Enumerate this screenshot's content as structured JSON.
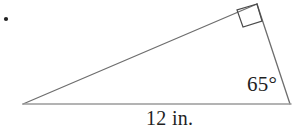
{
  "figure": {
    "kind": "right-triangle-diagram",
    "bullet": {
      "visible": true,
      "x": 6,
      "y": 19,
      "radius": 2,
      "color": "#222222"
    },
    "stroke_color": "#6e6e6e",
    "base_stroke_color": "#9a9a9a",
    "right_angle_stroke_color": "#4a4a4a",
    "vertices": {
      "left": {
        "x": 23,
        "y": 104
      },
      "right": {
        "x": 290,
        "y": 104
      },
      "top": {
        "x": 257,
        "y": 4
      }
    },
    "right_angle_marker": {
      "at_vertex": "top",
      "size": 18,
      "points": "257,4 237,10 243,27 262,21"
    },
    "labels": {
      "angle": "65°",
      "angle_value": 65,
      "angle_unit": "degrees",
      "angle_at_vertex": "right",
      "base": "12 in.",
      "base_value": 12,
      "base_unit": "in.",
      "base_side": "bottom"
    }
  }
}
